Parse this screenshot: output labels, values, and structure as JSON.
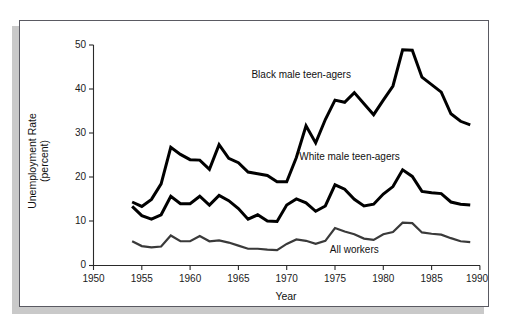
{
  "figure": {
    "frame_border_color": "#5a5a62",
    "shadow_color": "#c9c9c9",
    "background": "#ffffff"
  },
  "chart_data": {
    "type": "line",
    "title": "",
    "subtitle": "",
    "xlabel": "Year",
    "ylabel": "Unemployment Rate (percent)",
    "ylabel_line1": "Unemployment Rate",
    "ylabel_line2": "(percent)",
    "xlim": [
      1950,
      1990
    ],
    "ylim": [
      0,
      50
    ],
    "xticks": [
      1950,
      1955,
      1960,
      1965,
      1970,
      1975,
      1980,
      1985,
      1990
    ],
    "xtick_labels": [
      "1950",
      "1955",
      "1960",
      "1965",
      "1970",
      "1975",
      "1980",
      "1985",
      "1990"
    ],
    "yticks": [
      0,
      10,
      20,
      30,
      40,
      50
    ],
    "ytick_labels": [
      "0",
      "10",
      "20",
      "30",
      "40",
      "50"
    ],
    "grid": false,
    "legend_position": "inline-annotations",
    "x": [
      1954,
      1955,
      1956,
      1957,
      1958,
      1959,
      1960,
      1961,
      1962,
      1963,
      1964,
      1965,
      1966,
      1967,
      1968,
      1969,
      1970,
      1971,
      1972,
      1973,
      1974,
      1975,
      1976,
      1977,
      1978,
      1979,
      1980,
      1981,
      1982,
      1983,
      1984,
      1985,
      1986,
      1987,
      1988,
      1989
    ],
    "series": [
      {
        "name": "Black male teen-agers",
        "label": "Black male teen-agers",
        "color": "#000000",
        "stroke_width": 3.0,
        "label_x": 1971.5,
        "label_y": 42.5,
        "values": [
          14.4,
          13.4,
          15.0,
          18.5,
          26.8,
          25.2,
          24.0,
          23.9,
          21.8,
          27.4,
          24.3,
          23.3,
          21.2,
          20.8,
          20.4,
          19.0,
          19.0,
          24.5,
          31.7,
          27.8,
          33.1,
          37.5,
          37.0,
          39.2,
          36.7,
          34.2,
          37.5,
          40.7,
          48.9,
          48.8,
          42.7,
          41.0,
          39.3,
          34.4,
          32.7,
          31.9
        ]
      },
      {
        "name": "White male teen-agers",
        "label": "White male teen-agers",
        "color": "#000000",
        "stroke_width": 3.0,
        "label_x": 1976.5,
        "label_y": 24.0,
        "values": [
          13.4,
          11.3,
          10.5,
          11.5,
          15.7,
          14.0,
          14.0,
          15.7,
          13.7,
          15.9,
          14.7,
          12.9,
          10.5,
          11.5,
          10.1,
          10.0,
          13.7,
          15.1,
          14.2,
          12.3,
          13.5,
          18.3,
          17.3,
          15.0,
          13.5,
          13.9,
          16.2,
          17.9,
          21.7,
          20.2,
          16.8,
          16.5,
          16.3,
          14.4,
          13.9,
          13.7
        ]
      },
      {
        "name": "All workers",
        "label": "All workers",
        "color": "#3a3a3a",
        "stroke_width": 2.2,
        "label_x": 1977.0,
        "label_y": 2.8,
        "values": [
          5.5,
          4.4,
          4.1,
          4.3,
          6.8,
          5.5,
          5.5,
          6.7,
          5.5,
          5.7,
          5.2,
          4.5,
          3.8,
          3.8,
          3.6,
          3.5,
          4.9,
          5.9,
          5.6,
          4.9,
          5.6,
          8.5,
          7.7,
          7.1,
          6.1,
          5.8,
          7.1,
          7.6,
          9.7,
          9.6,
          7.5,
          7.2,
          7.0,
          6.2,
          5.5,
          5.3
        ]
      }
    ]
  }
}
